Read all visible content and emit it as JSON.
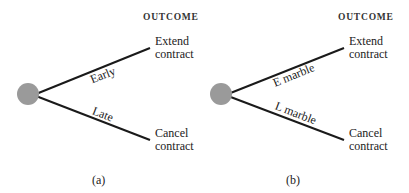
{
  "panels": [
    {
      "caption": "(a)",
      "header": "OUTCOME",
      "branches": [
        {
          "label": "Early",
          "outcome_line1": "Extend",
          "outcome_line2": "contract"
        },
        {
          "label": "Late",
          "outcome_line1": "Cancel",
          "outcome_line2": "contract"
        }
      ]
    },
    {
      "caption": "(b)",
      "header": "OUTCOME",
      "branches": [
        {
          "label": "E marble",
          "outcome_line1": "Extend",
          "outcome_line2": "contract"
        },
        {
          "label": "L marble",
          "outcome_line1": "Cancel",
          "outcome_line2": "contract"
        }
      ]
    }
  ],
  "colors": {
    "node": "#9a9a9a",
    "line": "#1a1a1a",
    "text": "#222222"
  }
}
